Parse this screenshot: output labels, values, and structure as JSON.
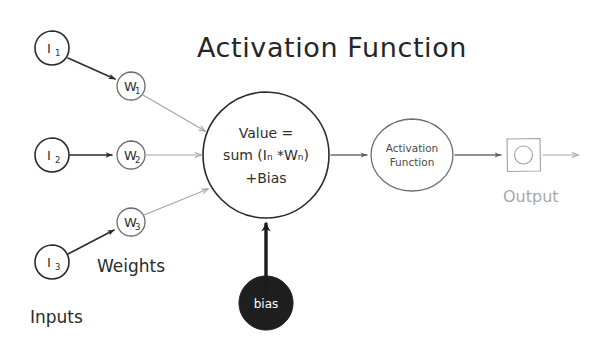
{
  "diagram": {
    "title": "Activation Function",
    "style": "hand-drawn sketch",
    "background_color": "#ffffff",
    "ink_color": "#2b2b2b",
    "light_ink_color": "#a6a6a6",
    "bias_fill_color": "#1f1f1f"
  },
  "labels": {
    "inputs": "Inputs",
    "weights": "Weights",
    "output": "Output"
  },
  "inputs": [
    {
      "id": "i1",
      "label": "I",
      "subscript": "1",
      "cx": 52,
      "cy": 48,
      "r": 17
    },
    {
      "id": "i2",
      "label": "I",
      "subscript": "2",
      "cx": 52,
      "cy": 155,
      "r": 17
    },
    {
      "id": "i3",
      "label": "I",
      "subscript": "3",
      "cx": 52,
      "cy": 262,
      "r": 17
    }
  ],
  "weights": [
    {
      "id": "w1",
      "label": "W",
      "subscript": "1",
      "cx": 131,
      "cy": 86,
      "r": 14
    },
    {
      "id": "w2",
      "label": "W",
      "subscript": "2",
      "cx": 131,
      "cy": 155,
      "r": 14
    },
    {
      "id": "w3",
      "label": "W",
      "subscript": "3",
      "cx": 131,
      "cy": 222,
      "r": 14
    }
  ],
  "summation_node": {
    "cx": 266,
    "cy": 155,
    "r": 63,
    "lines": [
      "Value =",
      "sum (Iₙ *Wₙ)",
      "+Bias"
    ],
    "line1": "Value =",
    "line2": "sum (Iₙ *Wₙ)",
    "line3": "+Bias"
  },
  "activation_node": {
    "cx": 412,
    "cy": 155,
    "rx": 41,
    "ry": 36,
    "line1": "Activation",
    "line2": "Function"
  },
  "bias_node": {
    "cx": 266,
    "cy": 303,
    "r": 27,
    "label": "bias"
  },
  "output_node": {
    "x": 507,
    "y": 138,
    "size": 33,
    "inner_circle_r": 9,
    "label": "Output"
  },
  "connections": [
    {
      "from": "i1",
      "to": "w1",
      "weight": "dark"
    },
    {
      "from": "i2",
      "to": "w2",
      "weight": "dark"
    },
    {
      "from": "i3",
      "to": "w3",
      "weight": "dark"
    },
    {
      "from": "w1",
      "to": "summation_node",
      "weight": "light"
    },
    {
      "from": "w2",
      "to": "summation_node",
      "weight": "light"
    },
    {
      "from": "w3",
      "to": "summation_node",
      "weight": "light"
    },
    {
      "from": "bias_node",
      "to": "summation_node",
      "weight": "thick"
    },
    {
      "from": "summation_node",
      "to": "activation_node",
      "weight": "mid"
    },
    {
      "from": "activation_node",
      "to": "output_node",
      "weight": "mid"
    },
    {
      "from": "output_node",
      "to": "end",
      "weight": "light"
    }
  ]
}
